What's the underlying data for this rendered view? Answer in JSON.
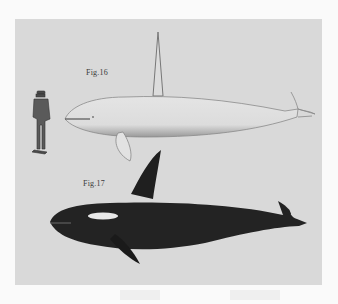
{
  "plate": {
    "background": "#d9d9d9",
    "figures": [
      {
        "label": "Fig.16",
        "subject": "pale whale with long tusk and human figure for scale"
      },
      {
        "label": "Fig.17",
        "subject": "killer whale (orca), dark with white eye patch"
      }
    ]
  },
  "page": {
    "background": "#fafafa"
  }
}
